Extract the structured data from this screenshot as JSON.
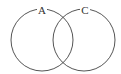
{
  "diagram": {
    "type": "venn",
    "sets": [
      {
        "label": "A",
        "cx": 42,
        "cy": 40,
        "r": 31
      },
      {
        "label": "C",
        "cx": 84,
        "cy": 40,
        "r": 31
      }
    ],
    "stroke_color": "#555555",
    "background": "#ffffff"
  }
}
